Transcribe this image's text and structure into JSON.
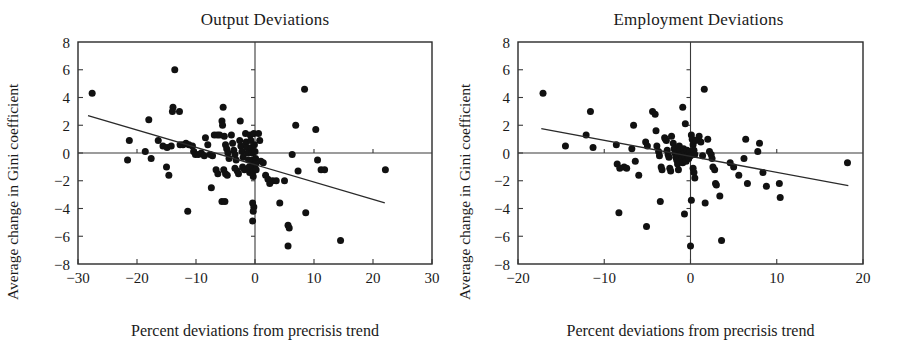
{
  "figure": {
    "type": "scatter-panel-pair",
    "width": 899,
    "height": 344
  },
  "panels": [
    {
      "id": "output-deviations",
      "title": "Output Deviations",
      "xlabel": "Percent deviations from precrisis trend",
      "ylabel": "Average change in Gini coefficient",
      "xticks": [
        "-30",
        "-20",
        "-10",
        "0",
        "10",
        "20",
        "30"
      ],
      "yticks": [
        "8",
        "6",
        "4",
        "2",
        "0",
        "-2",
        "-4",
        "-6",
        "-8"
      ]
    },
    {
      "id": "employment-deviations",
      "title": "Employment Deviations",
      "xlabel": "Percent deviations from precrisis trend",
      "ylabel": "Average change in Gini coefficient",
      "xticks": [
        "-20",
        "-10",
        "0",
        "10",
        "20"
      ],
      "yticks": [
        "8",
        "6",
        "4",
        "2",
        "0",
        "-2",
        "-4",
        "-6",
        "-8"
      ]
    }
  ],
  "chart_data": [
    {
      "type": "scatter",
      "title": "Output Deviations",
      "xlabel": "Percent deviations from precrisis trend",
      "ylabel": "Average change in Gini coefficient",
      "xlim": [
        -30,
        30
      ],
      "ylim": [
        -8,
        8
      ],
      "xticks": [
        -30,
        -20,
        -10,
        0,
        10,
        20,
        30
      ],
      "yticks": [
        -8,
        -6,
        -4,
        -2,
        0,
        2,
        4,
        6,
        8
      ],
      "grid": false,
      "legend": null,
      "reference_lines": {
        "horizontal": 0,
        "vertical": 0
      },
      "trendline": {
        "x": [
          -28.3,
          22.0
        ],
        "y": [
          2.7,
          -3.6
        ],
        "slope": -0.125,
        "intercept": -0.83
      },
      "points": [
        [
          -27.6,
          4.3
        ],
        [
          -13.6,
          6.0
        ],
        [
          -21.3,
          0.9
        ],
        [
          -21.6,
          -0.5
        ],
        [
          -18.6,
          0.1
        ],
        [
          -18.0,
          2.4
        ],
        [
          -17.6,
          -0.4
        ],
        [
          -16.4,
          0.9
        ],
        [
          -15.6,
          0.5
        ],
        [
          -14.9,
          0.4
        ],
        [
          -14.2,
          0.5
        ],
        [
          -13.9,
          3.3
        ],
        [
          -14.0,
          3.0
        ],
        [
          -12.8,
          3.0
        ],
        [
          -12.7,
          0.6
        ],
        [
          -12.2,
          0.6
        ],
        [
          -11.7,
          0.7
        ],
        [
          -11.2,
          0.6
        ],
        [
          -15.0,
          -1.0
        ],
        [
          -14.6,
          -1.6
        ],
        [
          -10.6,
          0.5
        ],
        [
          -10.4,
          0.1
        ],
        [
          -10.1,
          -0.1
        ],
        [
          -9.6,
          -0.1
        ],
        [
          -9.1,
          0.0
        ],
        [
          -11.4,
          -4.2
        ],
        [
          -8.4,
          1.1
        ],
        [
          -8.0,
          0.6
        ],
        [
          -7.6,
          -0.1
        ],
        [
          -7.2,
          -0.2
        ],
        [
          -6.9,
          1.3
        ],
        [
          -6.4,
          1.3
        ],
        [
          -6.0,
          1.3
        ],
        [
          -6.6,
          -1.2
        ],
        [
          -6.3,
          -1.5
        ],
        [
          -7.4,
          -2.5
        ],
        [
          -5.4,
          3.3
        ],
        [
          -5.6,
          2.3
        ],
        [
          -5.5,
          2.0
        ],
        [
          -5.2,
          1.2
        ],
        [
          -5.0,
          0.6
        ],
        [
          -4.8,
          0.3
        ],
        [
          -4.6,
          0.0
        ],
        [
          -4.4,
          -0.4
        ],
        [
          -5.3,
          -1.2
        ],
        [
          -5.0,
          -1.5
        ],
        [
          -4.7,
          -1.6
        ],
        [
          -5.6,
          -3.5
        ],
        [
          -5.1,
          -3.5
        ],
        [
          -4.0,
          1.3
        ],
        [
          -3.8,
          0.7
        ],
        [
          -3.6,
          0.2
        ],
        [
          -3.4,
          -0.1
        ],
        [
          -3.2,
          -0.5
        ],
        [
          -3.4,
          -1.1
        ],
        [
          -3.0,
          -1.3
        ],
        [
          -2.8,
          -1.5
        ],
        [
          -2.6,
          0.9
        ],
        [
          -2.4,
          0.5
        ],
        [
          -2.2,
          0.1
        ],
        [
          -2.0,
          -0.3
        ],
        [
          -2.1,
          -1.0
        ],
        [
          -1.8,
          -1.2
        ],
        [
          -1.6,
          1.4
        ],
        [
          -1.5,
          0.8
        ],
        [
          -1.4,
          0.4
        ],
        [
          -1.2,
          0.0
        ],
        [
          -1.1,
          -0.5
        ],
        [
          -1.0,
          -1.0
        ],
        [
          -0.9,
          -1.4
        ],
        [
          -0.8,
          1.3
        ],
        [
          -0.7,
          0.9
        ],
        [
          -0.6,
          0.4
        ],
        [
          -0.5,
          0.0
        ],
        [
          -0.4,
          -0.5
        ],
        [
          -0.4,
          -0.9
        ],
        [
          -0.3,
          -1.3
        ],
        [
          -0.3,
          -1.7
        ],
        [
          -0.2,
          1.4
        ],
        [
          -0.1,
          0.6
        ],
        [
          0.0,
          0.1
        ],
        [
          0.1,
          -0.4
        ],
        [
          0.1,
          -0.8
        ],
        [
          0.2,
          -1.2
        ],
        [
          -0.4,
          -3.6
        ],
        [
          -0.2,
          -3.9
        ],
        [
          -0.3,
          -4.2
        ],
        [
          -0.4,
          -4.9
        ],
        [
          0.6,
          1.4
        ],
        [
          0.8,
          0.9
        ],
        [
          1.0,
          -0.6
        ],
        [
          1.4,
          -0.7
        ],
        [
          1.8,
          -1.6
        ],
        [
          2.2,
          -1.9
        ],
        [
          2.5,
          -2.2
        ],
        [
          3.0,
          -2.0
        ],
        [
          3.6,
          -2.0
        ],
        [
          4.2,
          -3.6
        ],
        [
          5.0,
          -2.0
        ],
        [
          5.6,
          -5.2
        ],
        [
          5.8,
          -5.4
        ],
        [
          5.6,
          -6.7
        ],
        [
          6.3,
          -0.1
        ],
        [
          6.9,
          2.0
        ],
        [
          7.3,
          -1.3
        ],
        [
          8.4,
          4.6
        ],
        [
          8.6,
          -4.3
        ],
        [
          10.3,
          1.7
        ],
        [
          10.6,
          -0.5
        ],
        [
          11.2,
          -1.2
        ],
        [
          11.8,
          -1.2
        ],
        [
          14.5,
          -6.3
        ],
        [
          22.1,
          -1.2
        ],
        [
          -8.6,
          -0.2
        ],
        [
          -2.5,
          2.3
        ]
      ],
      "n_points": 117
    },
    {
      "type": "scatter",
      "title": "Employment Deviations",
      "xlabel": "Percent deviations from precrisis trend",
      "ylabel": "Average change in Gini coefficient",
      "xlim": [
        -20,
        20
      ],
      "ylim": [
        -8,
        8
      ],
      "xticks": [
        -20,
        -10,
        0,
        10,
        20
      ],
      "yticks": [
        -8,
        -6,
        -4,
        -2,
        0,
        2,
        4,
        6,
        8
      ],
      "grid": false,
      "legend": null,
      "reference_lines": {
        "horizontal": 0,
        "vertical": 0
      },
      "trendline": {
        "x": [
          -17.3,
          18.3
        ],
        "y": [
          1.75,
          -2.35
        ],
        "slope": -0.115,
        "intercept": -0.24
      },
      "points": [
        [
          -17.1,
          4.3
        ],
        [
          -14.5,
          0.5
        ],
        [
          -12.1,
          1.3
        ],
        [
          -11.6,
          3.0
        ],
        [
          -11.3,
          0.4
        ],
        [
          -8.6,
          0.6
        ],
        [
          -8.5,
          -0.8
        ],
        [
          -8.2,
          -1.1
        ],
        [
          -8.3,
          -4.3
        ],
        [
          -7.7,
          -1.0
        ],
        [
          -7.4,
          -1.1
        ],
        [
          -6.8,
          0.3
        ],
        [
          -6.6,
          2.0
        ],
        [
          -6.4,
          -0.6
        ],
        [
          -6.0,
          -1.6
        ],
        [
          -5.2,
          0.8
        ],
        [
          -5.0,
          0.5
        ],
        [
          -5.1,
          -5.3
        ],
        [
          -4.4,
          3.0
        ],
        [
          -4.1,
          2.8
        ],
        [
          -4.0,
          1.6
        ],
        [
          -3.9,
          0.5
        ],
        [
          -3.7,
          0.1
        ],
        [
          -3.6,
          -0.2
        ],
        [
          -3.4,
          -1.0
        ],
        [
          -3.3,
          -1.2
        ],
        [
          -3.5,
          -3.5
        ],
        [
          -3.0,
          1.1
        ],
        [
          -2.9,
          1.0
        ],
        [
          -2.8,
          0.9
        ],
        [
          -2.7,
          0.2
        ],
        [
          -2.6,
          -0.1
        ],
        [
          -2.5,
          -0.3
        ],
        [
          -2.4,
          -1.1
        ],
        [
          -2.3,
          -1.3
        ],
        [
          -2.0,
          0.7
        ],
        [
          -1.9,
          0.3
        ],
        [
          -1.8,
          0.0
        ],
        [
          -1.7,
          -0.3
        ],
        [
          -1.6,
          -0.5
        ],
        [
          -1.5,
          -0.8
        ],
        [
          -1.4,
          -1.2
        ],
        [
          -1.3,
          0.5
        ],
        [
          -1.2,
          0.2
        ],
        [
          -1.1,
          -0.1
        ],
        [
          -1.0,
          -0.4
        ],
        [
          -0.9,
          -0.7
        ],
        [
          -0.8,
          0.3
        ],
        [
          -0.7,
          0.0
        ],
        [
          -0.6,
          -0.3
        ],
        [
          -0.5,
          -0.6
        ],
        [
          -0.4,
          0.2
        ],
        [
          -0.3,
          -0.1
        ],
        [
          -0.2,
          -0.4
        ],
        [
          -0.1,
          0.1
        ],
        [
          0.0,
          -0.2
        ],
        [
          -0.9,
          3.3
        ],
        [
          -0.6,
          2.1
        ],
        [
          0.1,
          1.3
        ],
        [
          0.2,
          1.0
        ],
        [
          0.3,
          0.6
        ],
        [
          0.4,
          0.2
        ],
        [
          0.5,
          -0.1
        ],
        [
          0.3,
          -1.1
        ],
        [
          0.4,
          -1.4
        ],
        [
          0.5,
          -1.8
        ],
        [
          0.1,
          -3.4
        ],
        [
          -0.7,
          -4.4
        ],
        [
          0.0,
          -6.7
        ],
        [
          1.0,
          1.2
        ],
        [
          1.2,
          0.8
        ],
        [
          1.4,
          -0.2
        ],
        [
          1.6,
          4.6
        ],
        [
          1.7,
          -3.6
        ],
        [
          2.0,
          1.0
        ],
        [
          2.2,
          0.1
        ],
        [
          2.4,
          -0.1
        ],
        [
          2.5,
          -0.4
        ],
        [
          2.6,
          -1.0
        ],
        [
          2.8,
          -1.2
        ],
        [
          2.9,
          -2.2
        ],
        [
          3.0,
          -2.3
        ],
        [
          3.4,
          -3.1
        ],
        [
          3.6,
          -6.3
        ],
        [
          4.6,
          -0.7
        ],
        [
          5.0,
          -1.0
        ],
        [
          5.6,
          -1.6
        ],
        [
          6.4,
          1.0
        ],
        [
          6.2,
          -0.4
        ],
        [
          6.6,
          -2.2
        ],
        [
          7.8,
          0.1
        ],
        [
          8.0,
          0.7
        ],
        [
          8.4,
          -1.4
        ],
        [
          8.8,
          -2.4
        ],
        [
          10.3,
          -2.2
        ],
        [
          10.4,
          -3.2
        ],
        [
          18.2,
          -0.7
        ],
        [
          -2.2,
          1.2
        ],
        [
          0.6,
          0.9
        ]
      ],
      "n_points": 100
    }
  ]
}
